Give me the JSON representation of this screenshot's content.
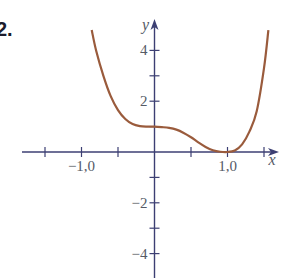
{
  "exercise_label": "2.",
  "chart_data": {
    "type": "line",
    "title": "",
    "xlabel": "x",
    "ylabel": "y",
    "x_tick_labels": [
      "-1,0",
      "1,0"
    ],
    "x_ticks": [
      -1.5,
      -1.0,
      -0.5,
      0.5,
      1.0,
      1.5
    ],
    "y_tick_labels": [
      "4",
      "2",
      "-2",
      "-4"
    ],
    "y_ticks": [
      -5,
      -4,
      -3,
      -2,
      -1,
      1,
      2,
      3,
      4
    ],
    "xlim": [
      -1.75,
      1.7
    ],
    "ylim": [
      -5,
      5
    ],
    "grid": false,
    "series": [
      {
        "name": "f(x)",
        "color": "#9a5b3c",
        "x": [
          -0.86,
          -0.8,
          -0.7,
          -0.6,
          -0.5,
          -0.4,
          -0.3,
          -0.2,
          -0.1,
          0.0,
          0.1,
          0.2,
          0.3,
          0.4,
          0.5,
          0.6,
          0.7,
          0.8,
          0.9,
          1.0,
          1.1,
          1.2,
          1.3,
          1.4,
          1.5,
          1.56
        ],
        "y": [
          4.8,
          4.0,
          3.0,
          2.2,
          1.65,
          1.3,
          1.1,
          1.02,
          1.0,
          1.0,
          0.98,
          0.95,
          0.88,
          0.75,
          0.58,
          0.38,
          0.2,
          0.07,
          0.01,
          0.0,
          0.06,
          0.3,
          0.8,
          1.6,
          3.3,
          4.8
        ]
      }
    ],
    "colors": {
      "axis": "#3c3f73",
      "curve": "#9a5b3c",
      "text": "#555a66"
    }
  }
}
